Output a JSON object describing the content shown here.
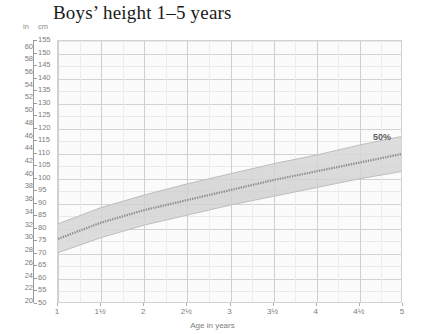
{
  "title": "Boys’ height 1–5 years",
  "axis": {
    "unit_left_label": "in",
    "unit_right_label": "cm",
    "x_title": "Age in years",
    "cm_ticks": [
      50,
      55,
      60,
      65,
      70,
      75,
      80,
      85,
      90,
      95,
      100,
      105,
      110,
      115,
      120,
      125,
      130,
      135,
      140,
      145,
      150,
      155
    ],
    "in_ticks": [
      20,
      22,
      24,
      26,
      28,
      30,
      32,
      34,
      36,
      38,
      40,
      42,
      44,
      46,
      48,
      50,
      52,
      54,
      56,
      58,
      60
    ],
    "x_ticks": [
      "1",
      "1½",
      "2",
      "2½",
      "3",
      "3½",
      "4",
      "4½",
      "5"
    ]
  },
  "annotations": {
    "percentile_label": "50%"
  },
  "colors": {
    "band_fill": "#d8d8d8",
    "median_line": "#8e8e8e",
    "grid_minor": "#ededed",
    "grid_major": "#cfcfcf",
    "text": "#7d7d7d",
    "title": "#1a1a1a"
  },
  "chart_data": {
    "type": "area",
    "title": "Boys’ height 1–5 years",
    "xlabel": "Age in years",
    "ylabel": "cm",
    "ylabel_secondary": "in",
    "xlim": [
      1,
      5
    ],
    "ylim": [
      50,
      155
    ],
    "ylim_secondary": [
      20,
      60
    ],
    "grid": true,
    "legend": "none",
    "x": [
      1,
      1.5,
      2,
      2.5,
      3,
      3.5,
      4,
      4.5,
      5
    ],
    "series": [
      {
        "name": "50th percentile (median height)",
        "values": [
          76.0,
          82.5,
          87.5,
          91.5,
          95.5,
          99.5,
          103.0,
          106.5,
          110.0
        ],
        "unit": "cm"
      },
      {
        "name": "upper band edge",
        "values": [
          82.0,
          88.5,
          93.5,
          98.0,
          102.0,
          106.0,
          109.5,
          113.5,
          117.0
        ],
        "unit": "cm"
      },
      {
        "name": "lower band edge",
        "values": [
          70.5,
          76.5,
          81.5,
          85.5,
          89.5,
          93.0,
          96.5,
          100.0,
          103.0
        ],
        "unit": "cm"
      }
    ],
    "annotations": [
      {
        "text": "50%",
        "x": 4.65,
        "y": 114
      }
    ]
  }
}
